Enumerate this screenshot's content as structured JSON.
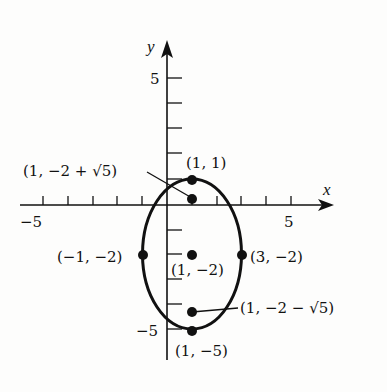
{
  "diagram": {
    "type": "ellipse-graph",
    "axes": {
      "x_label": "x",
      "y_label": "y",
      "x_tick_labels": {
        "neg": "−5",
        "pos": "5"
      },
      "y_tick_labels": {
        "pos": "5",
        "neg": "−5"
      },
      "x_range": [
        -6,
        6.5
      ],
      "y_range": [
        -6,
        7
      ]
    },
    "ellipse": {
      "center": [
        1,
        -2
      ],
      "a_horizontal": 2,
      "b_vertical": 3
    },
    "points": [
      {
        "id": "top-vertex",
        "coords": [
          1,
          1
        ],
        "label": "(1, 1)"
      },
      {
        "id": "upper-focus",
        "coords": [
          1,
          0.236
        ],
        "label": "(1, −2 + √5)"
      },
      {
        "id": "left-vertex",
        "coords": [
          -1,
          -2
        ],
        "label": "(−1, −2)"
      },
      {
        "id": "center",
        "coords": [
          1,
          -2
        ],
        "label": "(1, −2)"
      },
      {
        "id": "right-vertex",
        "coords": [
          3,
          -2
        ],
        "label": "(3, −2)"
      },
      {
        "id": "lower-focus",
        "coords": [
          1,
          -4.236
        ],
        "label": "(1, −2 − √5)"
      },
      {
        "id": "bottom-vertex",
        "coords": [
          1,
          -5
        ],
        "label": "(1, −5)"
      }
    ],
    "colors": {
      "ink": "#111111",
      "background": "#fdfdfc"
    }
  }
}
